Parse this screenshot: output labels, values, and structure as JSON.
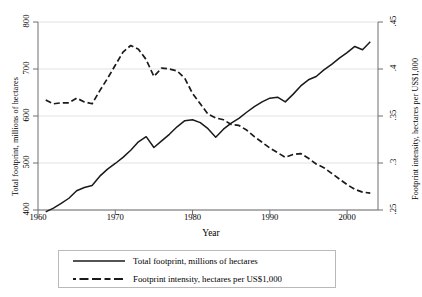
{
  "chart_data": {
    "type": "line",
    "title": "",
    "subtitle": "",
    "xlabel": "Year",
    "ylabel": "Total footprint, millions of hectares",
    "y2label": "Footprint intensity, hectares per US$1,000",
    "xlim": [
      1960,
      2004
    ],
    "ylim": [
      400,
      800
    ],
    "y2lim": [
      0.25,
      0.45
    ],
    "xticks": [
      "1960",
      "1970",
      "1980",
      "1990",
      "2000"
    ],
    "xtick_values": [
      1960,
      1970,
      1980,
      1990,
      2000
    ],
    "yticks": [
      "400",
      "500",
      "600",
      "700",
      "800"
    ],
    "ytick_values": [
      400,
      500,
      600,
      700,
      800
    ],
    "y2ticks": [
      ".25",
      ".3",
      ".35",
      ".4",
      ".45"
    ],
    "y2tick_values": [
      0.25,
      0.3,
      0.35,
      0.4,
      0.45
    ],
    "grid": "horizontal",
    "legend_position": "below",
    "x": [
      1961,
      1962,
      1963,
      1964,
      1965,
      1966,
      1967,
      1968,
      1969,
      1970,
      1971,
      1972,
      1973,
      1974,
      1975,
      1976,
      1977,
      1978,
      1979,
      1980,
      1981,
      1982,
      1983,
      1984,
      1985,
      1986,
      1987,
      1988,
      1989,
      1990,
      1991,
      1992,
      1993,
      1994,
      1995,
      1996,
      1997,
      1998,
      1999,
      2000,
      2001,
      2002,
      2003
    ],
    "series": [
      {
        "name": "Total footprint, millions of hectares",
        "axis": "left",
        "style": "solid",
        "color": "#1a1a1a",
        "values": [
          396,
          404,
          414,
          425,
          441,
          448,
          452,
          472,
          487,
          499,
          512,
          527,
          545,
          556,
          533,
          547,
          561,
          577,
          590,
          592,
          586,
          573,
          555,
          572,
          585,
          595,
          608,
          620,
          630,
          638,
          640,
          630,
          646,
          664,
          677,
          684,
          698,
          710,
          723,
          735,
          748,
          741,
          758
        ]
      },
      {
        "name": "Footprint intensity, hectares per US$1,000",
        "axis": "right",
        "style": "dashed",
        "color": "#1a1a1a",
        "values": [
          0.367,
          0.363,
          0.364,
          0.364,
          0.369,
          0.365,
          0.363,
          0.377,
          0.39,
          0.404,
          0.418,
          0.425,
          0.421,
          0.41,
          0.392,
          0.401,
          0.4,
          0.398,
          0.39,
          0.374,
          0.363,
          0.352,
          0.348,
          0.346,
          0.341,
          0.34,
          0.335,
          0.328,
          0.322,
          0.316,
          0.311,
          0.306,
          0.309,
          0.31,
          0.305,
          0.299,
          0.295,
          0.289,
          0.283,
          0.277,
          0.272,
          0.269,
          0.268
        ]
      }
    ]
  },
  "axes": {
    "left_title": "Total footprint, millions of hectares",
    "right_title": "Footprint intensity, hectares per US$1,000",
    "x_title": "Year"
  },
  "legend": {
    "items": [
      {
        "label": "Total footprint, millions of hectares",
        "style": "solid"
      },
      {
        "label": "Footprint intensity, hectares per US$1,000",
        "style": "dashed"
      }
    ]
  }
}
